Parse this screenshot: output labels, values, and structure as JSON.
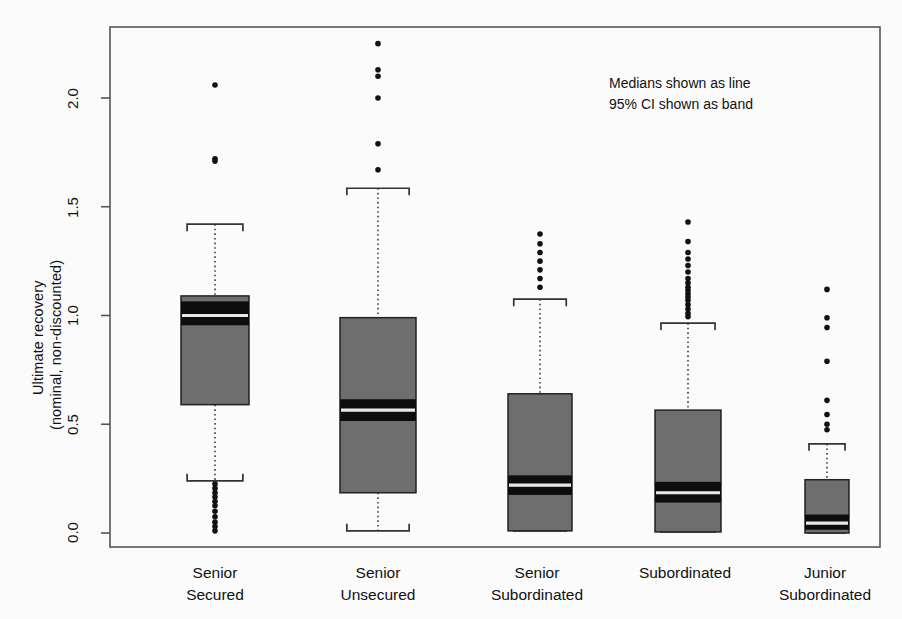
{
  "chart_data": {
    "type": "box",
    "title": "",
    "xlabel": "",
    "ylabel": "Ultimate recovery\n(nominal, non-discounted)",
    "ylabel_line1": "Ultimate recovery",
    "ylabel_line2": "(nominal, non-discounted)",
    "ylim": [
      -0.07,
      2.33
    ],
    "yticks": [
      0.0,
      0.5,
      1.0,
      1.5,
      2.0
    ],
    "ytick_labels": [
      "0.0",
      "0.5",
      "1.0",
      "1.5",
      "2.0"
    ],
    "grid": false,
    "legend": "none",
    "annotations": [
      "Medians shown as line",
      "95% CI shown as band"
    ],
    "categories": [
      "Senior\nSecured",
      "Senior\nUnsecured",
      "Senior\nSubordinated",
      "Subordinated",
      "Junior\nSubordinated"
    ],
    "category_lines": [
      [
        "Senior",
        "Secured"
      ],
      [
        "Senior",
        "Unsecured"
      ],
      [
        "Senior",
        "Subordinated"
      ],
      [
        "Subordinated",
        ""
      ],
      [
        "Junior",
        "Subordinated"
      ]
    ],
    "boxes": [
      {
        "name": "Senior Secured",
        "q1": 0.59,
        "q3": 1.09,
        "median": 1.0,
        "ci_low": 0.955,
        "ci_high": 1.065,
        "whisker_low": 0.24,
        "whisker_high": 1.42,
        "outliers_high": [
          2.06,
          1.72,
          1.71
        ],
        "outliers_low": [
          0.225,
          0.205,
          0.185,
          0.165,
          0.145,
          0.125,
          0.1,
          0.075,
          0.05,
          0.03,
          0.01
        ]
      },
      {
        "name": "Senior Unsecured",
        "q1": 0.185,
        "q3": 0.99,
        "median": 0.565,
        "ci_low": 0.515,
        "ci_high": 0.615,
        "whisker_low": 0.01,
        "whisker_high": 1.585,
        "outliers_high": [
          2.25,
          2.13,
          2.1,
          2.0,
          1.79,
          1.67
        ],
        "outliers_low": []
      },
      {
        "name": "Senior Subordinated",
        "q1": 0.01,
        "q3": 0.64,
        "median": 0.22,
        "ci_low": 0.175,
        "ci_high": 0.265,
        "whisker_low": 0.01,
        "whisker_high": 1.075,
        "outliers_high": [
          1.375,
          1.33,
          1.29,
          1.25,
          1.21,
          1.17,
          1.13
        ],
        "outliers_low": []
      },
      {
        "name": "Subordinated",
        "q1": 0.005,
        "q3": 0.565,
        "median": 0.185,
        "ci_low": 0.14,
        "ci_high": 0.235,
        "whisker_low": 0.005,
        "whisker_high": 0.965,
        "outliers_high": [
          1.43,
          1.34,
          1.29,
          1.26,
          1.23,
          1.2,
          1.17,
          1.15,
          1.13,
          1.115,
          1.1,
          1.085,
          1.07,
          1.05,
          1.03,
          1.01,
          0.995
        ],
        "outliers_low": []
      },
      {
        "name": "Junior Subordinated",
        "q1": 0.0,
        "q3": 0.245,
        "median": 0.045,
        "ci_low": 0.015,
        "ci_high": 0.085,
        "whisker_low": 0.0,
        "whisker_high": 0.41,
        "outliers_high": [
          1.12,
          0.99,
          0.945,
          0.79,
          0.61,
          0.545,
          0.5,
          0.475
        ],
        "outliers_low": []
      }
    ],
    "colors": {
      "box_fill": "#6e6e6e",
      "box_edge": "#222222",
      "ci_band": "#0d0d0d",
      "median_line": "#e8e8e8",
      "outlier": "#111111",
      "axis": "#555555",
      "background": "#fbfbfb"
    }
  }
}
